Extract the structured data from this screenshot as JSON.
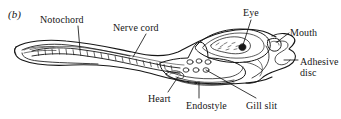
{
  "figure": {
    "panel_tag": "(b)",
    "ink_color": "#161616",
    "background_color": "#ffffff"
  },
  "labels": [
    {
      "id": "notochord",
      "text": "Notochord",
      "icon": "leader-line-icon"
    },
    {
      "id": "nerve_cord",
      "text": "Nerve cord",
      "icon": "leader-line-icon"
    },
    {
      "id": "eye",
      "text": "Eye",
      "icon": "leader-line-icon"
    },
    {
      "id": "mouth",
      "text": "Mouth",
      "icon": "leader-line-icon"
    },
    {
      "id": "adhesive",
      "text": "Adhesive disc",
      "icon": "leader-line-icon"
    },
    {
      "id": "heart",
      "text": "Heart",
      "icon": "leader-line-icon"
    },
    {
      "id": "endostyle",
      "text": "Endostyle",
      "icon": "leader-line-icon"
    },
    {
      "id": "gill_slit",
      "text": "Gill slit",
      "icon": "leader-line-icon"
    }
  ],
  "structures": [
    "body-outline",
    "tail-fin",
    "notochord-band",
    "nerve-cord-line",
    "myomere-segments",
    "pharyngeal-basket",
    "gill-slit-pores",
    "endostyle-groove",
    "heart-loop",
    "eye-pigment-spot",
    "mouth-opening",
    "adhesive-disc-lobes"
  ]
}
